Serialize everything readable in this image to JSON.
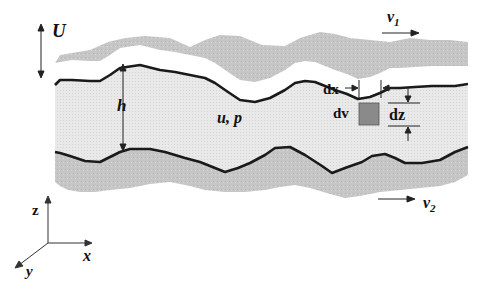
{
  "diagram": {
    "labels": {
      "U": "U",
      "h": "h",
      "u_p": "u, p",
      "v1_base": "v",
      "v1_sub": "1",
      "v2_base": "v",
      "v2_sub": "2",
      "dx": "dx",
      "dz": "dz",
      "dv": "dv",
      "axis_z": "z",
      "axis_x": "x",
      "axis_y": "y"
    },
    "colors": {
      "surface_fill": "#c8c8c8",
      "film_fill": "#ececec",
      "boundary_line": "#1a1a1a",
      "element_fill": "#8a8a8a"
    }
  }
}
